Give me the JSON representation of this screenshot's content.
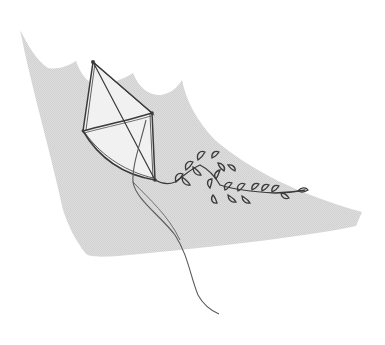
{
  "illustration": {
    "subject": "Pencil sketch of a kite with a leafy tail and trailing string",
    "background_shape_color": "#d9d9d9",
    "line_color": "#3a3a3a",
    "string_color": "#6a6a6a"
  }
}
